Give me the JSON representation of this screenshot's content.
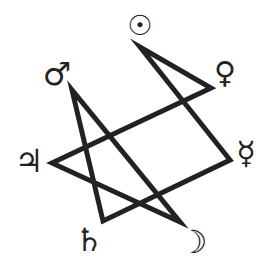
{
  "diagram": {
    "type": "heptagram",
    "stroke_color": "#222222",
    "background": "#ffffff",
    "vertices": [
      {
        "name": "sun",
        "x": 140,
        "y": 47
      },
      {
        "name": "venus",
        "x": 211,
        "y": 88
      },
      {
        "name": "mercury",
        "x": 230,
        "y": 160
      },
      {
        "name": "moon",
        "x": 180,
        "y": 222
      },
      {
        "name": "saturn",
        "x": 103,
        "y": 221
      },
      {
        "name": "jupiter",
        "x": 52,
        "y": 163
      },
      {
        "name": "mars",
        "x": 72,
        "y": 90
      }
    ],
    "symbols": {
      "sun": "☉",
      "venus": "♀",
      "mercury": "☿",
      "moon": "☽",
      "saturn": "♄",
      "jupiter": "♃",
      "mars": "♂"
    }
  }
}
